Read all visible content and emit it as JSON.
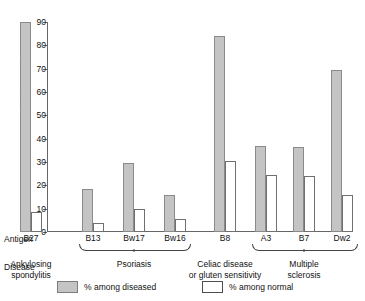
{
  "chart_data": {
    "type": "bar",
    "title": "",
    "xlabel": "Antigen",
    "ylabel": "Percentage having antigen",
    "ylim": [
      0,
      90
    ],
    "yticks": [
      0,
      10,
      20,
      30,
      40,
      50,
      60,
      70,
      80,
      90
    ],
    "grid": false,
    "legend_position": "bottom",
    "categories": [
      "B27",
      "B13",
      "Bw17",
      "Bw16",
      "B8",
      "A3",
      "B7",
      "Dw2"
    ],
    "series": [
      {
        "name": "% among diseased",
        "color": "#c4c4c4",
        "values": [
          90,
          18.5,
          29.5,
          16,
          84,
          37,
          36.5,
          69.5
        ]
      },
      {
        "name": "% among normal",
        "color": "#ffffff",
        "values": [
          8.5,
          4,
          10,
          5.5,
          30.5,
          24.5,
          24,
          16
        ]
      }
    ],
    "groups": [
      {
        "label": "Ankylosing\nspondylitis",
        "antigens": [
          "B27"
        ],
        "bracket": false
      },
      {
        "label": "Psoriasis",
        "antigens": [
          "B13",
          "Bw17",
          "Bw16"
        ],
        "bracket": true
      },
      {
        "label": "Celiac disease\nor gluten sensitivity",
        "antigens": [
          "B8"
        ],
        "bracket": false
      },
      {
        "label": "Multiple sclerosis",
        "antigens": [
          "A3",
          "B7",
          "Dw2"
        ],
        "bracket": true
      }
    ]
  },
  "axis": {
    "y_title": "Percentage having antigen",
    "tick_labels": [
      "0",
      "10",
      "20",
      "30",
      "40",
      "50",
      "60",
      "70",
      "80",
      "90"
    ]
  },
  "rows": {
    "antigen_key": "Antigen",
    "disease_key": "Disease",
    "antigens": [
      "B27",
      "B13",
      "Bw17",
      "Bw16",
      "B8",
      "A3",
      "B7",
      "Dw2"
    ],
    "diseases": [
      {
        "line1": "Ankylosing",
        "line2": "spondylitis"
      },
      {
        "line1": "Psoriasis",
        "line2": ""
      },
      {
        "line1": "Celiac disease",
        "line2": "or gluten sensitivity"
      },
      {
        "line1": "Multiple sclerosis",
        "line2": ""
      }
    ]
  },
  "legend": {
    "items": [
      {
        "label": "% among diseased",
        "style": "diseased"
      },
      {
        "label": "% among normal",
        "style": "normal"
      }
    ]
  }
}
